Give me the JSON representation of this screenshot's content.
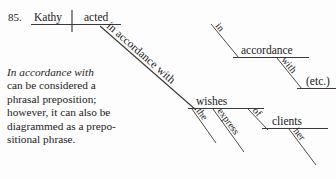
{
  "page": {
    "item_number": "85.",
    "background_color": "#fdfdfd",
    "ink_color": "#1a1a1a",
    "line_color": "#3a3a3a",
    "width": 336,
    "height": 179
  },
  "diagram": {
    "type": "reed-kellogg sentence diagram",
    "subject": "Kathy",
    "verb": "acted",
    "main_modifier": "in accordance with",
    "object_of_phrasal_preposition": "wishes",
    "wishes_modifiers": [
      "the",
      "express"
    ],
    "wishes_prep": "of",
    "wishes_prep_object": "clients",
    "clients_modifier": "her",
    "alt_prep": "in",
    "alt_prep_object": "accordance",
    "alt_second_prep": "with",
    "alt_second_object": "(etc.)"
  },
  "note": {
    "lines": [
      "In accordance with",
      "can be considered a",
      "phrasal preposition;",
      "however, it can also be",
      "diagrammed as a prepo-",
      "sitional phrase."
    ],
    "italic_line_index": 0
  }
}
